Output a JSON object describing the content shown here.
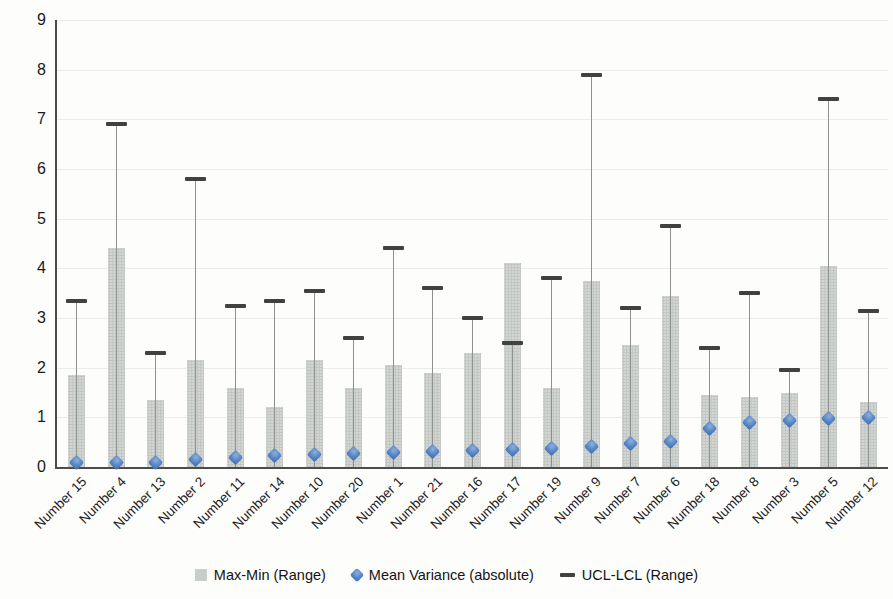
{
  "chart_data": {
    "type": "bar",
    "title": "",
    "xlabel": "",
    "ylabel": "",
    "categories": [
      "Number 15",
      "Number 4",
      "Number 13",
      "Number 2",
      "Number 11",
      "Number 14",
      "Number 10",
      "Number 20",
      "Number 1",
      "Number 21",
      "Number 16",
      "Number 17",
      "Number 19",
      "Number 9",
      "Number 7",
      "Number 6",
      "Number 18",
      "Number 8",
      "Number 3",
      "Number 5",
      "Number 12"
    ],
    "series": [
      {
        "name": "Max-Min (Range)",
        "render": "bar",
        "color": "#d3d6d3",
        "values": [
          1.85,
          4.4,
          1.35,
          2.15,
          1.6,
          1.2,
          2.15,
          1.6,
          2.05,
          1.9,
          2.3,
          4.1,
          1.6,
          3.75,
          2.45,
          3.45,
          1.45,
          1.4,
          1.5,
          4.05,
          1.3
        ]
      },
      {
        "name": "Mean Variance (absolute)",
        "render": "diamond-marker",
        "color": "#4f81bd",
        "values": [
          0.1,
          0.1,
          0.1,
          0.15,
          0.2,
          0.23,
          0.25,
          0.28,
          0.3,
          0.32,
          0.33,
          0.35,
          0.37,
          0.42,
          0.47,
          0.52,
          0.78,
          0.9,
          0.94,
          0.97,
          1.0
        ]
      },
      {
        "name": "UCL-LCL (Range)",
        "render": "whisker-with-top-cap",
        "color": "#414141",
        "values": [
          3.35,
          6.9,
          2.3,
          5.8,
          3.25,
          3.35,
          3.55,
          2.6,
          4.4,
          3.6,
          3.0,
          2.5,
          3.8,
          7.9,
          3.2,
          4.85,
          2.4,
          3.5,
          1.95,
          7.4,
          3.15
        ]
      }
    ],
    "ylim": [
      0,
      9
    ],
    "y_ticks": [
      0,
      1,
      2,
      3,
      4,
      5,
      6,
      7,
      8,
      9
    ],
    "grid": "horizontal-faint",
    "legend_position": "bottom",
    "x_label_rotation_deg": 45,
    "colors": {
      "axis": "#4c4c4c",
      "gridline": "#ececec",
      "whisker_line": "#8f9090",
      "tick_label": "#1b1b1b"
    }
  }
}
